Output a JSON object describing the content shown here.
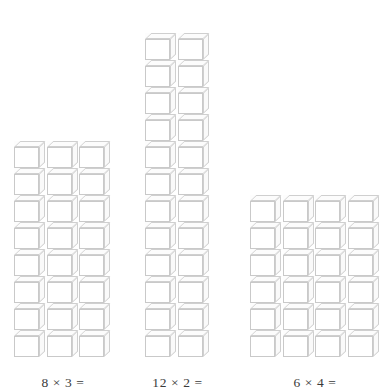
{
  "page": {
    "background_color": "#ffffff",
    "width": 385,
    "height": 391
  },
  "style": {
    "cube_line_color": "#c9c9c9",
    "cube_face_color": "#ffffff",
    "label_color": "#3a3a3a"
  },
  "groups": [
    {
      "id": "group-8x3",
      "label": "8 × 3 =",
      "columns": 3,
      "rows": 8,
      "total": 24,
      "left": 14,
      "multiplicand": 8,
      "multiplier": 3
    },
    {
      "id": "group-12x2",
      "label": "12 × 2 =",
      "columns": 2,
      "rows": 12,
      "total": 24,
      "left": 145,
      "multiplicand": 12,
      "multiplier": 2
    },
    {
      "id": "group-6x4",
      "label": "6 × 4 =",
      "columns": 4,
      "rows": 6,
      "total": 24,
      "left": 250,
      "multiplicand": 6,
      "multiplier": 4
    }
  ]
}
